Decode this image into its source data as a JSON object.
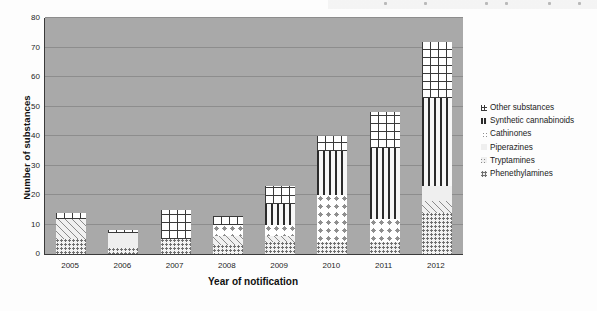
{
  "chart_data": {
    "type": "bar",
    "subtype": "stacked-bar",
    "title": "",
    "xlabel": "Year of notification",
    "ylabel": "Number of substances",
    "categories": [
      "2005",
      "2006",
      "2007",
      "2008",
      "2009",
      "2010",
      "2011",
      "2012"
    ],
    "ylim": [
      0,
      80
    ],
    "yticks": [
      0,
      10,
      20,
      30,
      40,
      50,
      60,
      70,
      80
    ],
    "ytick_labels": [
      "0",
      "10",
      "20",
      "30",
      "40",
      "50",
      "60",
      "70",
      "80"
    ],
    "grid": true,
    "grid_axis": "y",
    "legend_position": "right",
    "stack_order_bottom_to_top": [
      "Phenethylamines",
      "Tryptamines",
      "Piperazines",
      "Cathinones",
      "Synthetic cannabinoids",
      "Other substances"
    ],
    "series": [
      {
        "name": "Phenethylamines",
        "pattern": "small-dots",
        "values": [
          5,
          2,
          5,
          3,
          4,
          4,
          4,
          14
        ]
      },
      {
        "name": "Tryptamines",
        "pattern": "diagonal-hatch",
        "values": [
          7,
          0,
          0,
          3,
          2,
          0,
          0,
          4
        ]
      },
      {
        "name": "Piperazines",
        "pattern": "solid-light",
        "values": [
          0,
          5,
          0,
          0,
          0,
          0,
          0,
          5
        ]
      },
      {
        "name": "Cathinones",
        "pattern": "large-dots",
        "values": [
          0,
          0,
          0,
          4,
          4,
          16,
          8,
          0
        ]
      },
      {
        "name": "Synthetic cannabinoids",
        "pattern": "vertical-lines",
        "values": [
          0,
          0,
          0,
          0,
          7,
          15,
          24,
          30
        ]
      },
      {
        "name": "Other substances",
        "pattern": "grid-crosshatch",
        "values": [
          2,
          1,
          10,
          3,
          6,
          5,
          12,
          19
        ]
      }
    ],
    "totals": [
      14,
      8,
      15,
      13,
      23,
      40,
      48,
      72
    ]
  },
  "legend": {
    "items": [
      {
        "label": "Other substances",
        "key": "other-substances"
      },
      {
        "label": "Synthetic cannabinoids",
        "key": "synthetic-cannabinoids"
      },
      {
        "label": "Cathinones",
        "key": "cathinones"
      },
      {
        "label": "Piperazines",
        "key": "piperazines"
      },
      {
        "label": "Tryptamines",
        "key": "tryptamines"
      },
      {
        "label": "Phenethylamines",
        "key": "phenethylamines"
      }
    ]
  },
  "colors": {
    "plot_background": "#a9a9a9",
    "page_background": "#fdfdfd",
    "axis": "#3a3a3a",
    "gridline": "#8d8d8d",
    "text": "#1b1b1b"
  }
}
